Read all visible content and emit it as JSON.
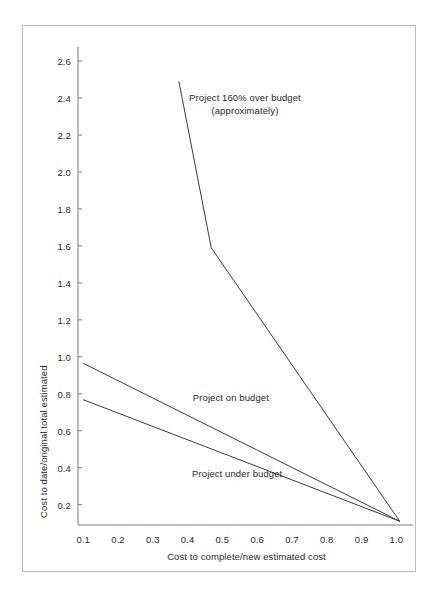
{
  "chart_data": {
    "type": "line",
    "title": "",
    "subtitle": "",
    "xlabel": "Cost to complete/new estimated cost",
    "ylabel": "Cost to date/original total estimated",
    "xlim": [
      0.085,
      1.025
    ],
    "ylim": [
      0.09,
      2.66
    ],
    "xticks": [
      "0.1",
      "0.2",
      "0.3",
      "0.4",
      "0.5",
      "0.6",
      "0.7",
      "0.8",
      "0.9",
      "1.0"
    ],
    "xtick_values": [
      0.1,
      0.2,
      0.3,
      0.4,
      0.5,
      0.6,
      0.7,
      0.8,
      0.9,
      1.0
    ],
    "yticks": [
      "0.2",
      "0.4",
      "0.6",
      "0.8",
      "1.0",
      "1.2",
      "1.4",
      "1.6",
      "1.8",
      "2.0",
      "2.2",
      "2.4",
      "2.6"
    ],
    "ytick_values": [
      0.2,
      0.4,
      0.6,
      0.8,
      1.0,
      1.2,
      1.4,
      1.6,
      1.8,
      2.0,
      2.2,
      2.4,
      2.6
    ],
    "grid": false,
    "legend": "none",
    "line_color": "#3a3a3a",
    "axis_color": "#7a7a7a",
    "frame_color": "#b9b9b9",
    "series": [
      {
        "name": "Project 160% over budget (approximately)",
        "points": [
          {
            "x": 0.375,
            "y": 2.49
          },
          {
            "x": 0.468,
            "y": 1.59
          },
          {
            "x": 1.01,
            "y": 0.11
          }
        ]
      },
      {
        "name": "Project on budget",
        "points": [
          {
            "x": 0.1,
            "y": 0.965
          },
          {
            "x": 1.01,
            "y": 0.11
          }
        ]
      },
      {
        "name": "Project under budget",
        "points": [
          {
            "x": 0.1,
            "y": 0.768
          },
          {
            "x": 1.01,
            "y": 0.11
          }
        ]
      }
    ],
    "annotations": [
      {
        "id": "over-budget",
        "line1": "Project 160% over budget",
        "line2": "(approximately)",
        "x": 0.565,
        "y": 2.44
      },
      {
        "id": "on-budget",
        "line1": "Project on budget",
        "line2": "",
        "x": 0.415,
        "y": 0.815
      },
      {
        "id": "under-budget",
        "line1": "Project under budget",
        "line2": "",
        "x": 0.413,
        "y": 0.405
      }
    ]
  }
}
